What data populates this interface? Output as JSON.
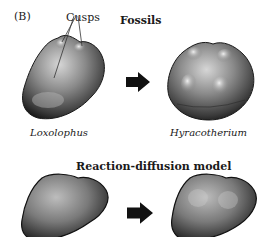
{
  "figure": {
    "panel_label": "(B)",
    "annotation": "Cusps",
    "fossils": {
      "title": "Fossils",
      "left_species": "Loxolophus",
      "right_species": "Hyracotherium"
    },
    "model": {
      "title": "Reaction-diffusion model"
    },
    "arrows": [
      "right-arrow",
      "right-arrow"
    ],
    "colors": {
      "tooth_dark": "#1c1c1c",
      "tooth_mid": "#6e6e6e",
      "tooth_light": "#c8c8c8",
      "arrow": "#111111"
    }
  }
}
